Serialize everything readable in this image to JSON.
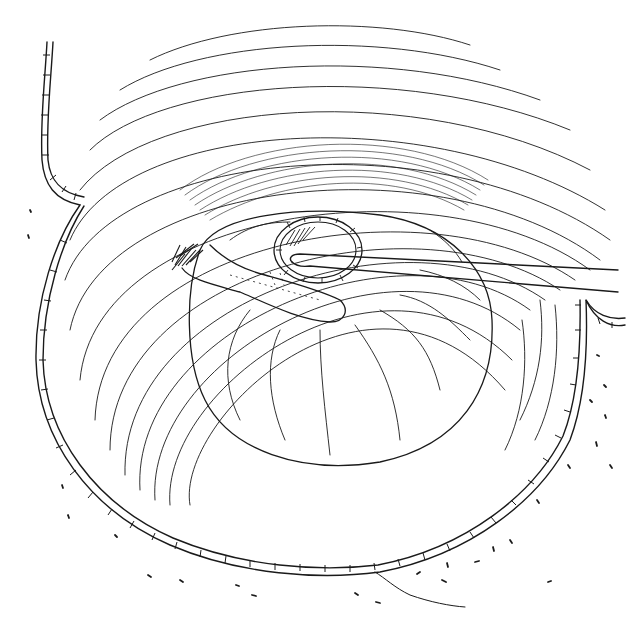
{
  "illustration": {
    "subject": "medical line drawing: circular surgical cavity with concentric fibrous rings, inner oval cavity, a probe/instrument inserted into a small rimmed pocket, and a tongue-shaped flap of tissue",
    "colors": {
      "ink": "#1a1a1a",
      "background": "#ffffff"
    },
    "elements": [
      "outer-epithelial-border",
      "concentric-fiber-rings",
      "inner-cavity",
      "rimmed-pocket",
      "probe-instrument",
      "tissue-flap",
      "hair-tuft",
      "stipple-marks",
      "crease-line"
    ]
  }
}
